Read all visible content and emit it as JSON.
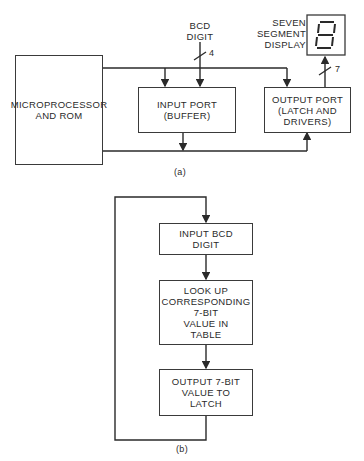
{
  "figure_a": {
    "caption": "(a)",
    "microprocessor": {
      "line1": "MICROPROCESSOR",
      "line2": "AND ROM"
    },
    "input_port": {
      "line1": "INPUT PORT",
      "line2": "(BUFFER)"
    },
    "output_port": {
      "line1": "OUTPUT PORT",
      "line2": "(LATCH AND",
      "line3": "DRIVERS)"
    },
    "bcd_label": {
      "line1": "BCD",
      "line2": "DIGIT"
    },
    "bcd_bus_width": "4",
    "display_label": {
      "line1": "SEVEN",
      "line2": "SEGMENT",
      "line3": "DISPLAY"
    },
    "display_bus_width": "7",
    "display_digit": "8"
  },
  "figure_b": {
    "caption": "(b)",
    "steps": [
      {
        "line1": "INPUT BCD",
        "line2": "DIGIT"
      },
      {
        "line1": "LOOK UP",
        "line2": "CORRESPONDING",
        "line3": "7-BIT",
        "line4": "VALUE IN",
        "line5": "TABLE"
      },
      {
        "line1": "OUTPUT 7-BIT",
        "line2": "VALUE TO",
        "line3": "LATCH"
      }
    ]
  }
}
